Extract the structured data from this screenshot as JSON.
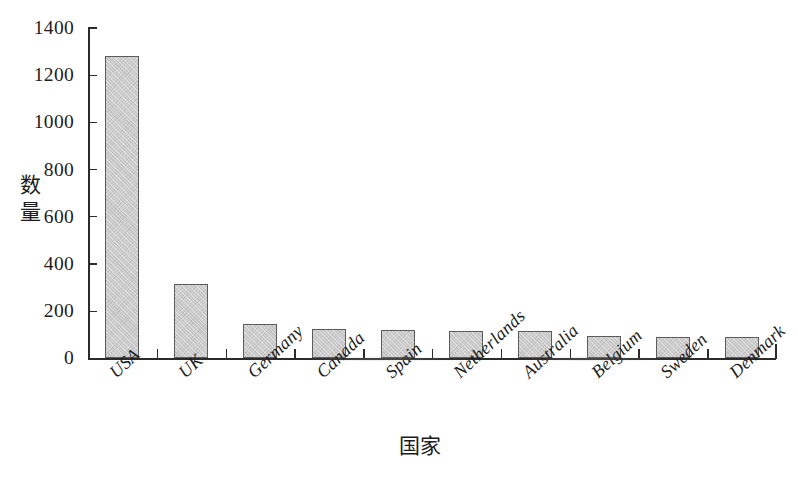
{
  "chart_data": {
    "type": "bar",
    "title": "",
    "xlabel": "国家",
    "ylabel": "数量",
    "categories": [
      "USA",
      "UK",
      "Germany",
      "Canada",
      "Spain",
      "Netherlands",
      "Australia",
      "Belgium",
      "Sweden",
      "Denmark"
    ],
    "values": [
      1280,
      315,
      145,
      125,
      120,
      115,
      118,
      95,
      92,
      90
    ],
    "ylim": [
      0,
      1400
    ],
    "yticks": [
      0,
      200,
      400,
      600,
      800,
      1000,
      1200,
      1400
    ],
    "ytick_labels": [
      "0",
      "200",
      "400",
      "600",
      "800",
      "1000",
      "1200",
      "1400"
    ],
    "grid": false,
    "legend": false,
    "bar_fill_color": "#c9c9c9",
    "bar_edge_color": "#5c5c5c",
    "axis_color": "#2b2b2b",
    "background_color": "#ffffff",
    "xlabel_rotation": -43
  }
}
